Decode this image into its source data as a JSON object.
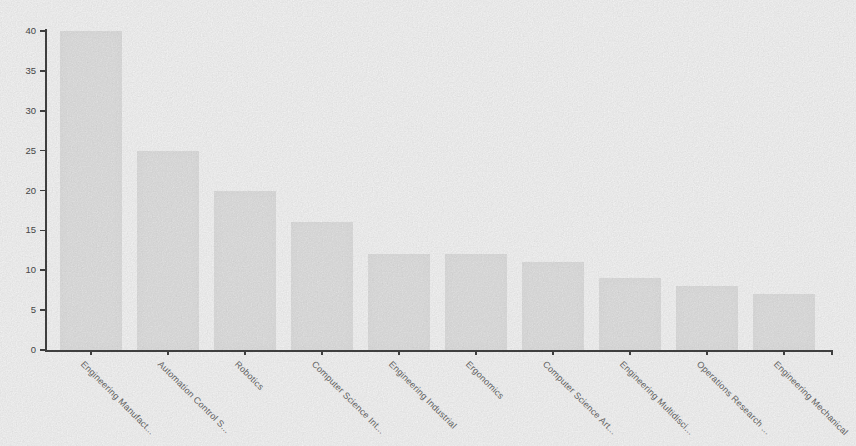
{
  "chart_data": {
    "type": "bar",
    "title": "",
    "xlabel": "",
    "ylabel": "",
    "categories": [
      "Engineering Manufact...",
      "Automation Control S...",
      "Robotics",
      "Computer Science Int...",
      "Engineering Industrial",
      "Ergonomics",
      "Computer Science Art...",
      "Engineering Multidisci...",
      "Operations Research ...",
      "Engineering Mechanical"
    ],
    "values": [
      40,
      25,
      20,
      16,
      12,
      12,
      11,
      9,
      8,
      7
    ],
    "ylim": [
      0,
      40
    ],
    "yticks": [
      0,
      5,
      10,
      15,
      20,
      25,
      30,
      35,
      40
    ],
    "grid": false,
    "legend": null,
    "bar_color": "#eaeaea",
    "axis_color": "#454545",
    "ytick_label_color": "#4c4c4c",
    "xtick_label_color": "#6b6b6b",
    "background_color": "#fdfdfd"
  }
}
